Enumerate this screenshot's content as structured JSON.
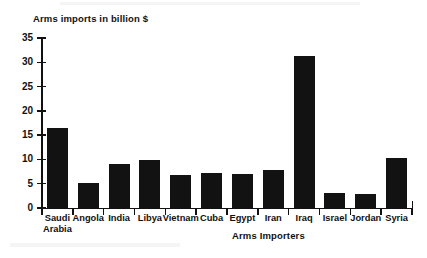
{
  "chart_data": {
    "type": "bar",
    "title": "",
    "ylabel": "Arms imports in billion $",
    "xlabel": "Arms Importers",
    "ylim": [
      0,
      35
    ],
    "ytick_step": 5,
    "ytick_labels": [
      "0",
      "5",
      "10",
      "15",
      "20",
      "25",
      "30",
      "35"
    ],
    "ytick_values": [
      0,
      5,
      10,
      15,
      20,
      25,
      30,
      35
    ],
    "grid": false,
    "legend": false,
    "bar_color": "#121212",
    "axis_color": "#111111",
    "background": "#ffffff",
    "categories": [
      "Saudi\nArabia",
      "Angola",
      "India",
      "Libya",
      "Vietnam",
      "Cuba",
      "Egypt",
      "Iran",
      "Iraq",
      "Israel",
      "Jordan",
      "Syria"
    ],
    "categories_plain": [
      "Saudi Arabia",
      "Angola",
      "India",
      "Libya",
      "Vietnam",
      "Cuba",
      "Egypt",
      "Iran",
      "Iraq",
      "Israel",
      "Jordan",
      "Syria"
    ],
    "values": [
      16.5,
      5.2,
      9.0,
      9.9,
      6.8,
      7.3,
      7.1,
      7.8,
      31.2,
      3.0,
      2.8,
      10.2
    ]
  }
}
